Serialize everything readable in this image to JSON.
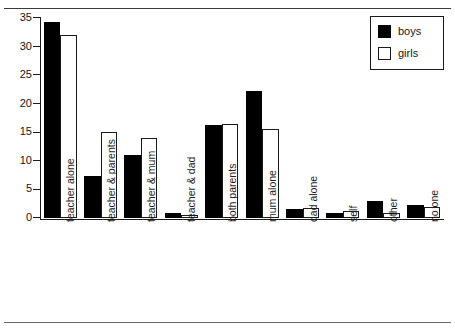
{
  "chart_data": {
    "type": "bar",
    "title": "",
    "xlabel": "",
    "ylabel": "",
    "ylim": [
      0,
      35
    ],
    "yticks": [
      0,
      5,
      10,
      15,
      20,
      25,
      30,
      35
    ],
    "grid": false,
    "legend_position": "top-right",
    "categories": [
      "teacher alone",
      "teacher & parents",
      "teacher & mum",
      "teacher & dad",
      "both parents",
      "mum alone",
      "dad alone",
      "self",
      "other",
      "no one"
    ],
    "series": [
      {
        "name": "boys",
        "color": "#000000",
        "values": [
          34.3,
          7.4,
          11.1,
          0.9,
          16.3,
          22.3,
          1.5,
          0.8,
          3.0,
          2.2
        ]
      },
      {
        "name": "girls",
        "color": "#ffffff",
        "values": [
          32.0,
          15.0,
          14.0,
          0.6,
          16.5,
          15.6,
          1.8,
          1.3,
          0.8,
          2.0
        ]
      }
    ]
  },
  "legend": {
    "entries": [
      {
        "label": "boys",
        "swatch": "filled-black-square"
      },
      {
        "label": "girls",
        "swatch": "outline-white-square"
      }
    ]
  },
  "axis": {
    "y_tick_labels": [
      "0",
      "5",
      "10",
      "15",
      "20",
      "25",
      "30",
      "35"
    ]
  },
  "colors": {
    "boys": "#000000",
    "girls": "#ffffff",
    "axis": "#1a1a1a",
    "text": "#161616",
    "rule": "#3a3a3a"
  }
}
